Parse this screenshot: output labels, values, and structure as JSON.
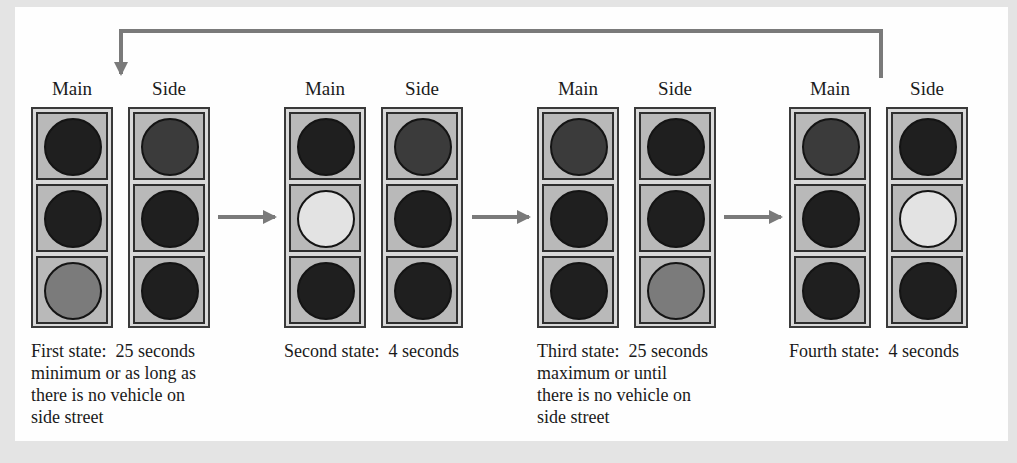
{
  "colors": {
    "off": "#1f1f1f",
    "red_on": "#3b3b3b",
    "yellow_on": "#e3e3e3",
    "green_on": "#7b7b7b",
    "arrow": "#7a7a7a"
  },
  "labels": {
    "main": "Main",
    "side": "Side"
  },
  "states": [
    {
      "name": "First state",
      "caption": "First state:  25 seconds\nminimum or as long as\nthere is no vehicle on\nside street",
      "main": [
        "off",
        "off",
        "green_on"
      ],
      "side": [
        "red_on",
        "off",
        "off"
      ]
    },
    {
      "name": "Second state",
      "caption": "Second state:  4 seconds",
      "main": [
        "off",
        "yellow_on",
        "off"
      ],
      "side": [
        "red_on",
        "off",
        "off"
      ]
    },
    {
      "name": "Third state",
      "caption": "Third state:  25 seconds\nmaximum or until\nthere is no vehicle on\nside street",
      "main": [
        "red_on",
        "off",
        "off"
      ],
      "side": [
        "off",
        "off",
        "green_on"
      ]
    },
    {
      "name": "Fourth state",
      "caption": "Fourth state:  4 seconds",
      "main": [
        "red_on",
        "off",
        "off"
      ],
      "side": [
        "off",
        "yellow_on",
        "off"
      ]
    }
  ],
  "transitions": [
    {
      "from": "First state",
      "to": "Second state"
    },
    {
      "from": "Second state",
      "to": "Third state"
    },
    {
      "from": "Third state",
      "to": "Fourth state"
    },
    {
      "from": "Fourth state",
      "to": "First state",
      "type": "feedback-loop"
    }
  ]
}
